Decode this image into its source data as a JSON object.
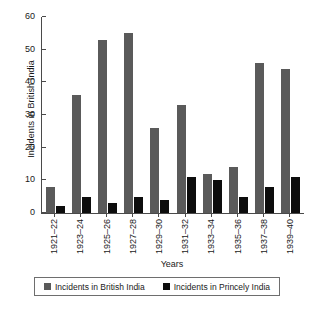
{
  "chart_data": {
    "type": "bar",
    "title": "",
    "xlabel": "Years",
    "ylabel": "Incidents in British India",
    "ylim": [
      0,
      60
    ],
    "yticks": [
      0,
      10,
      20,
      30,
      40,
      50,
      60
    ],
    "grid": false,
    "legend_position": "bottom",
    "categories": [
      "1921–22",
      "1923–24",
      "1925–26",
      "1927–28",
      "1929–30",
      "1931–32",
      "1933–34",
      "1935–36",
      "1937–38",
      "1939–40"
    ],
    "series": [
      {
        "name": "Incidents in British India",
        "color": "#5a5a5a",
        "values": [
          8,
          36,
          53,
          55,
          26,
          33,
          12,
          14,
          46,
          44
        ]
      },
      {
        "name": "Incidents in Princely India",
        "color": "#0d0d0d",
        "values": [
          2,
          5,
          3,
          5,
          4,
          11,
          10,
          5,
          8,
          11
        ]
      }
    ]
  },
  "legend": {
    "entries": [
      {
        "label": "Incidents in British India",
        "color": "#5a5a5a"
      },
      {
        "label": "Incidents in Princely India",
        "color": "#0d0d0d"
      }
    ]
  }
}
